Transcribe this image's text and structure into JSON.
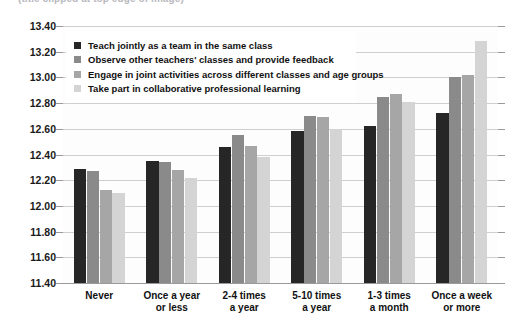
{
  "chart_data": {
    "type": "bar",
    "title": "",
    "title_partial": "(title clipped at top edge of image)",
    "xlabel": "",
    "ylabel": "",
    "ylim": [
      11.4,
      13.4
    ],
    "ytick_step": 0.2,
    "yticks": [
      "13.40",
      "13.20",
      "13.00",
      "12.80",
      "12.60",
      "12.40",
      "12.20",
      "12.00",
      "11.80",
      "11.60",
      "11.40"
    ],
    "ytick_values": [
      13.4,
      13.2,
      13.0,
      12.8,
      12.6,
      12.4,
      12.2,
      12.0,
      11.8,
      11.6,
      11.4
    ],
    "grid": true,
    "legend_position": "top-left",
    "categories": [
      "Never",
      "Once a year or less",
      "2-4 times a year",
      "5-10 times a year",
      "1-3 times a month",
      "Once a week or more"
    ],
    "category_lines": [
      [
        "Never"
      ],
      [
        "Once a year",
        "or less"
      ],
      [
        "2-4 times",
        "a year"
      ],
      [
        "5-10 times",
        "a year"
      ],
      [
        "1-3 times",
        "a month"
      ],
      [
        "Once a week",
        "or more"
      ]
    ],
    "series": [
      {
        "name": "Teach jointly as a team in the same class",
        "color": "#262626",
        "values": [
          12.29,
          12.35,
          12.46,
          12.58,
          12.62,
          12.72
        ]
      },
      {
        "name": "Observe other teachers' classes and provide feedback",
        "color": "#8a8a8a",
        "values": [
          12.27,
          12.34,
          12.55,
          12.7,
          12.85,
          13.0
        ]
      },
      {
        "name": "Engage in joint activities across different classes and age groups",
        "color": "#a6a6a6",
        "values": [
          12.12,
          12.28,
          12.47,
          12.69,
          12.87,
          13.02
        ]
      },
      {
        "name": "Take part in collaborative professional learning",
        "color": "#d4d4d4",
        "values": [
          12.1,
          12.22,
          12.38,
          12.6,
          12.81,
          13.28
        ]
      }
    ]
  },
  "colors": {
    "gridline": "#cfcfcf",
    "axis": "#9a9a9a",
    "plot_background": "#fdfdfd",
    "page_background": "#ffffff",
    "text": "#111111"
  }
}
